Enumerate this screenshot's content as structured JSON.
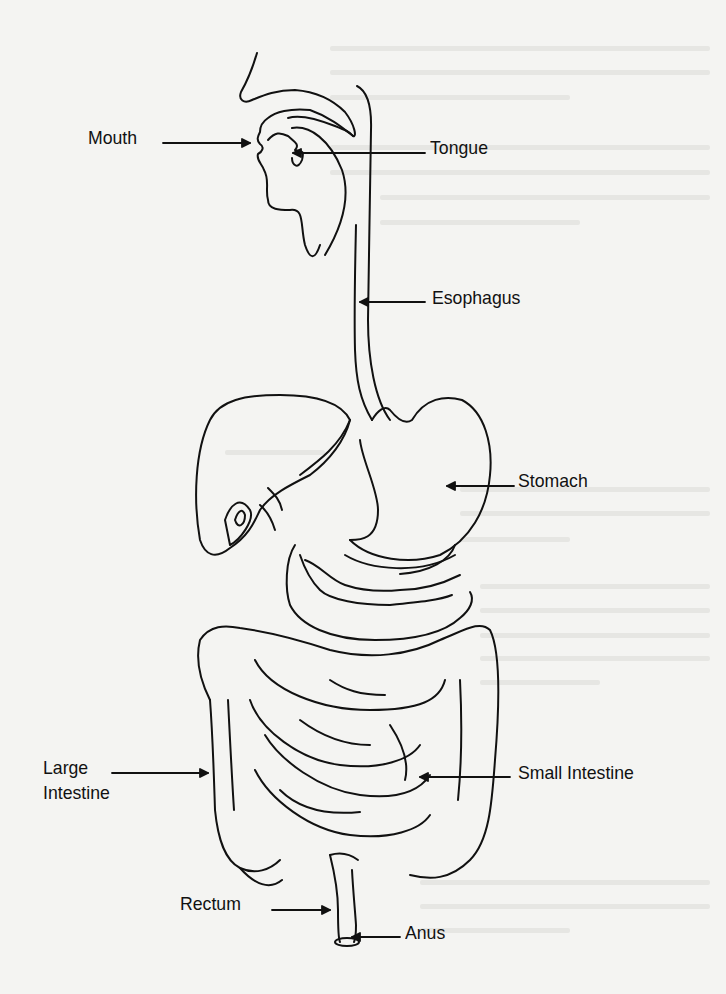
{
  "diagram": {
    "stroke_color": "#111111",
    "background_color": "#f4f4f2",
    "labels": {
      "mouth": "Mouth",
      "tongue": "Tongue",
      "esophagus": "Esophagus",
      "stomach": "Stomach",
      "large_intestine_line1": "Large",
      "large_intestine_line2": "Intestine",
      "small_intestine": "Small Intestine",
      "rectum": "Rectum",
      "anus": "Anus"
    }
  }
}
